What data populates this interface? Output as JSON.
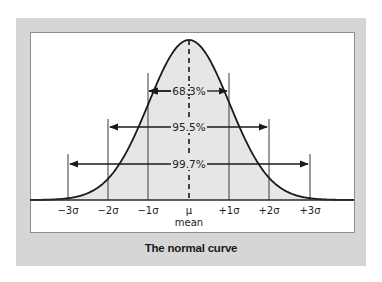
{
  "chart_data": {
    "type": "area",
    "title": "The normal curve",
    "xlabel": "mean",
    "ylabel": "",
    "distribution": "normal",
    "mean_symbol": "μ",
    "x_ticks": [
      "−3σ",
      "−2σ",
      "−1σ",
      "μ",
      "+1σ",
      "+2σ",
      "+3σ"
    ],
    "x_tick_values": [
      -3,
      -2,
      -1,
      0,
      1,
      2,
      3
    ],
    "intervals": [
      {
        "range": [
          -1,
          1
        ],
        "label": "68.3%",
        "value": 68.3
      },
      {
        "range": [
          -2,
          2
        ],
        "label": "95.5%",
        "value": 95.5
      },
      {
        "range": [
          -3,
          3
        ],
        "label": "99.7%",
        "value": 99.7
      }
    ],
    "grid": false,
    "legend": null,
    "fill_color": "#e6e6e6",
    "line_color": "#1a1a1a",
    "frame_color": "#d6d6d6"
  },
  "labels": {
    "ticks": [
      "−3σ",
      "−2σ",
      "−1σ",
      "μ",
      "+1σ",
      "+2σ",
      "+3σ"
    ],
    "mean_word": "mean",
    "pct_1": "68.3%",
    "pct_2": "95.5%",
    "pct_3": "99.7%",
    "caption": "The normal curve"
  }
}
